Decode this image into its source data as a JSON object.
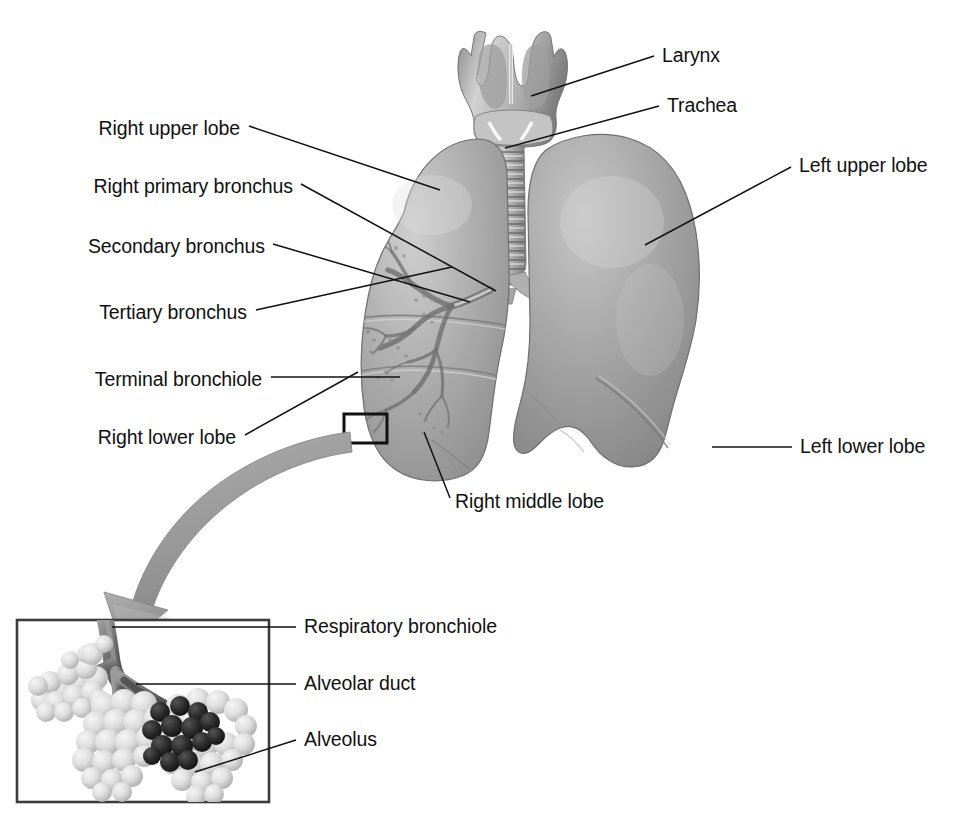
{
  "figure": {
    "kind": "anatomical-illustration",
    "background_color": "#ffffff",
    "leader_line_color": "#111111",
    "label_text_color": "#111111"
  },
  "labels": {
    "right_upper_lobe": "Right upper lobe",
    "right_primary_bronchus": "Right primary bronchus",
    "secondary_bronchus": "Secondary bronchus",
    "tertiary_bronchus": "Tertiary bronchus",
    "terminal_bronchiole": "Terminal bronchiole",
    "right_lower_lobe": "Right lower lobe",
    "right_middle_lobe": "Right middle lobe",
    "larynx": "Larynx",
    "trachea": "Trachea",
    "left_upper_lobe": "Left upper lobe",
    "left_lower_lobe": "Left lower lobe",
    "respiratory_bronchiole": "Respiratory bronchiole",
    "alveolar_duct": "Alveolar duct",
    "alveolus": "Alveolus"
  },
  "structures": {
    "larynx": {
      "name": "larynx",
      "tone": "#b9b9b9"
    },
    "trachea": {
      "name": "trachea",
      "tone": "#c2c2c2",
      "rings": 14
    },
    "right_lung": {
      "name": "right-lung",
      "tone": "#a9a9a9",
      "lobes": 3
    },
    "left_lung": {
      "name": "left-lung",
      "tone": "#9f9f9f",
      "lobes": 2
    },
    "bronchial_tree": {
      "name": "bronchial-tree",
      "tone": "#8a8a8a"
    },
    "detail_box": {
      "name": "detail-box",
      "stroke": "#111111"
    },
    "zoom_arrow": {
      "name": "zoom-arrow",
      "tone": "#9a9a9a"
    },
    "inset": {
      "name": "alveoli-inset",
      "stroke": "#3c3c3c",
      "alveoli_tone": "#dcdcdc",
      "dark_alveoli_tone": "#2a2a2a",
      "duct_tone": "#6e6e6e"
    }
  },
  "label_positions": {
    "right_upper_lobe": {
      "x": 240,
      "y": 131,
      "align": "right"
    },
    "right_primary_bronchus": {
      "x": 293,
      "y": 189,
      "align": "right"
    },
    "secondary_bronchus": {
      "x": 265,
      "y": 249,
      "align": "right"
    },
    "tertiary_bronchus": {
      "x": 247,
      "y": 315,
      "align": "right"
    },
    "terminal_bronchiole": {
      "x": 262,
      "y": 382,
      "align": "right"
    },
    "right_lower_lobe": {
      "x": 236,
      "y": 440,
      "align": "right"
    },
    "right_middle_lobe": {
      "x": 455,
      "y": 504,
      "align": "left"
    },
    "larynx": {
      "x": 662,
      "y": 61,
      "align": "left"
    },
    "trachea": {
      "x": 667,
      "y": 111,
      "align": "left"
    },
    "left_upper_lobe": {
      "x": 799,
      "y": 172,
      "align": "left"
    },
    "left_lower_lobe": {
      "x": 800,
      "y": 452,
      "align": "left"
    },
    "respiratory_bronchiole": {
      "x": 304,
      "y": 632,
      "align": "left"
    },
    "alveolar_duct": {
      "x": 304,
      "y": 689,
      "align": "left"
    },
    "alveolus": {
      "x": 304,
      "y": 745,
      "align": "left"
    }
  }
}
